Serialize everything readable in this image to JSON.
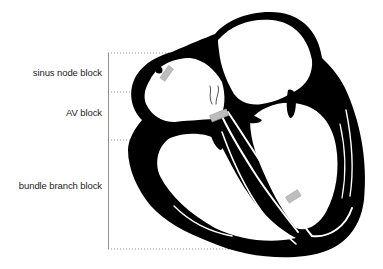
{
  "diagram": {
    "labels": [
      {
        "id": "sinus-node-block",
        "text": "sinus node block"
      },
      {
        "id": "av-block",
        "text": "AV block"
      },
      {
        "id": "bundle-branch-block",
        "text": "bundle branch block"
      }
    ],
    "colors": {
      "heart": "#000000",
      "conduction": "#ffffff",
      "block_marker": "#b8b8b8",
      "guide_lines": "#777777",
      "text": "#222222"
    }
  }
}
